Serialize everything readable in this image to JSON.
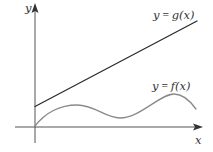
{
  "diagram": {
    "type": "function-graph",
    "axes": {
      "x_label": "x",
      "y_label": "y",
      "color": "#3a3a3a"
    },
    "curves": [
      {
        "id": "g",
        "label": "y = g(x)",
        "label_parts": {
          "var": "y",
          "eq": " = ",
          "func": "g(x)"
        },
        "kind": "line",
        "color": "#2b2b2b"
      },
      {
        "id": "f",
        "label": "y = f(x)",
        "label_parts": {
          "var": "y",
          "eq": " = ",
          "func": "f(x)"
        },
        "kind": "wave",
        "color": "#8a8a8a"
      }
    ]
  }
}
